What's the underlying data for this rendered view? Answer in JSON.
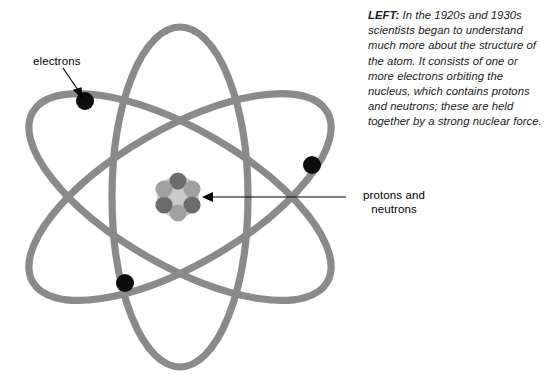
{
  "figure": {
    "colors": {
      "orbit": "#8a8a8a",
      "electron": "#0d0d0d",
      "nucleus_core": "#c9c9c9",
      "nucleus_particle_dark": "#6e6e6e",
      "nucleus_particle_light": "#a3a3a3",
      "background": "#ffffff",
      "text": "#000000"
    },
    "orbits": [
      {
        "name": "orbit-1",
        "rotation_deg": 0,
        "rx": 68,
        "ry": 170
      },
      {
        "name": "orbit-2",
        "rotation_deg": 60,
        "rx": 68,
        "ry": 170
      },
      {
        "name": "orbit-3",
        "rotation_deg": 120,
        "rx": 68,
        "ry": 170
      }
    ],
    "electrons": [
      {
        "name": "electron-upper-left",
        "x": 85,
        "y": 101,
        "r": 9
      },
      {
        "name": "electron-right",
        "x": 312,
        "y": 165,
        "r": 9
      },
      {
        "name": "electron-lower-left",
        "x": 125,
        "y": 283,
        "r": 9
      }
    ],
    "nucleus": {
      "center_x": 178,
      "center_y": 197,
      "core_radius": 21,
      "particle_radius": 8.5,
      "particle_count": 6
    }
  },
  "labels": {
    "electrons": "electrons",
    "protons_and_neutrons": "protons and neutrons"
  },
  "caption": {
    "lead": "LEFT:",
    "body": " In the 1920s and 1930s scientists began to understand much more about the structure of the atom. It consists of one or more electrons orbiting the nucleus, which contains protons and neutrons; these are held together by a strong nuclear force."
  }
}
